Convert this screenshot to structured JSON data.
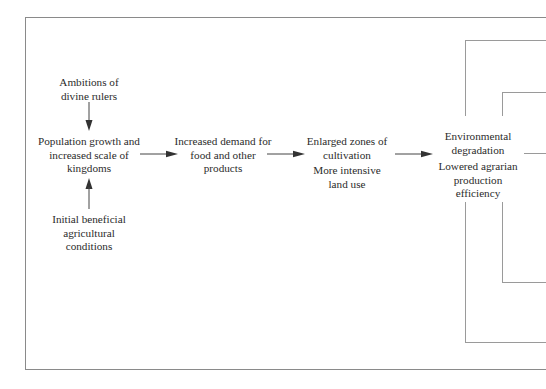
{
  "diagram": {
    "nodes": {
      "ambitions": {
        "lines": [
          "Ambitions of",
          "divine rulers"
        ]
      },
      "population": {
        "lines": [
          "Population growth and",
          "increased scale of",
          "kingdoms"
        ]
      },
      "initial": {
        "lines": [
          "Initial beneficial",
          "agricultural",
          "conditions"
        ]
      },
      "demand": {
        "lines": [
          "Increased demand for",
          "food and other",
          "products"
        ]
      },
      "enlarged": {
        "lines": [
          "Enlarged zones of",
          "cultivation"
        ]
      },
      "intensive": {
        "lines": [
          "More intensive",
          "land use"
        ]
      },
      "environmental": {
        "lines": [
          "Environmental",
          "degradation"
        ]
      },
      "lowered": {
        "lines": [
          "Lowered agrarian",
          "production",
          "efficiency"
        ]
      }
    },
    "edges": [
      {
        "from": "ambitions",
        "to": "population"
      },
      {
        "from": "initial",
        "to": "population"
      },
      {
        "from": "population",
        "to": "demand"
      },
      {
        "from": "demand",
        "to": "enlarged"
      },
      {
        "from": "enlarged",
        "to": "environmental"
      }
    ],
    "colors": {
      "text": "#2b2b2b",
      "lines": "#8a8a8a",
      "arrows": "#333333"
    }
  }
}
